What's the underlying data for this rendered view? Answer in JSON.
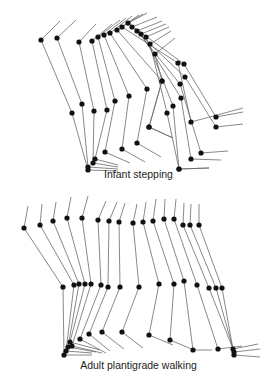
{
  "figures": [
    {
      "id": "infant",
      "caption": "Infant stepping",
      "caption_y": 176,
      "frames": [
        {
          "trunk": [
            [
              41,
              40
            ],
            [
              60,
              21
            ]
          ],
          "hip": [
            41,
            40
          ],
          "knee": [
            72,
            113
          ],
          "ankle": [
            88,
            170
          ],
          "toe": [
            118,
            171
          ]
        },
        {
          "trunk": [
            [
              57,
              38
            ],
            [
              76,
              20
            ]
          ],
          "hip": [
            57,
            38
          ],
          "knee": [
            82,
            104
          ],
          "ankle": [
            88,
            167
          ],
          "toe": [
            118,
            169
          ]
        },
        {
          "trunk": [
            [
              79,
              42
            ],
            [
              96,
              24
            ]
          ],
          "hip": [
            79,
            42
          ],
          "knee": [
            94,
            111
          ],
          "ankle": [
            93,
            163
          ],
          "toe": [
            118,
            167
          ]
        },
        {
          "trunk": [
            [
              92,
              41
            ],
            [
              112,
              24
            ]
          ],
          "hip": [
            92,
            41
          ],
          "knee": [
            107,
            110
          ],
          "ankle": [
            95,
            159
          ],
          "toe": [
            118,
            165
          ]
        },
        {
          "trunk": [
            [
              98,
              37
            ],
            [
              120,
              20
            ]
          ],
          "hip": [
            98,
            37
          ],
          "knee": [
            115,
            101
          ],
          "ankle": [
            105,
            152
          ],
          "toe": [
            130,
            163
          ]
        },
        {
          "trunk": [
            [
              104,
              35
            ],
            [
              126,
              18
            ]
          ],
          "hip": [
            104,
            35
          ],
          "knee": [
            129,
            96
          ],
          "ankle": [
            122,
            149
          ],
          "toe": [
            145,
            162
          ]
        },
        {
          "trunk": [
            [
              110,
              33
            ],
            [
              132,
              16
            ]
          ],
          "hip": [
            110,
            33
          ],
          "knee": [
            147,
            89
          ],
          "ankle": [
            137,
            143
          ],
          "toe": [
            161,
            157
          ]
        },
        {
          "trunk": [
            [
              117,
              30
            ],
            [
              139,
              15
            ]
          ],
          "hip": [
            117,
            30
          ],
          "knee": [
            162,
            81
          ],
          "ankle": [
            149,
            127
          ],
          "toe": [
            173,
            138
          ]
        },
        {
          "trunk": [
            [
              122,
              27
            ],
            [
              143,
              14
            ]
          ],
          "hip": [
            122,
            27
          ],
          "knee": [
            178,
            63
          ],
          "ankle": [
            191,
            122
          ],
          "toe": [
            243,
            108
          ]
        },
        {
          "trunk": [
            [
              128,
              23
            ],
            [
              147,
              13
            ]
          ],
          "hip": [
            128,
            23
          ],
          "knee": [
            184,
            64
          ],
          "ankle": [
            216,
            117
          ],
          "toe": [
            243,
            112
          ]
        },
        {
          "trunk": [
            [
              132,
              27
            ],
            [
              157,
              17
            ]
          ],
          "hip": [
            132,
            27
          ],
          "knee": [
            185,
            77
          ],
          "ankle": [
            216,
            127
          ],
          "toe": [
            243,
            124
          ]
        },
        {
          "trunk": [
            [
              137,
              31
            ],
            [
              162,
              21
            ]
          ],
          "hip": [
            137,
            31
          ],
          "knee": [
            180,
            84
          ],
          "ankle": [
            201,
            153
          ],
          "toe": [
            228,
            151
          ]
        },
        {
          "trunk": [
            [
              141,
              34
            ],
            [
              166,
              24
            ]
          ],
          "hip": [
            141,
            34
          ],
          "knee": [
            181,
            98
          ],
          "ankle": [
            191,
            159
          ],
          "toe": [
            221,
            160
          ]
        },
        {
          "trunk": [
            [
              146,
              37
            ],
            [
              169,
              27
            ]
          ],
          "hip": [
            146,
            37
          ],
          "knee": [
            173,
            106
          ],
          "ankle": [
            179,
            169
          ],
          "toe": [
            209,
            168
          ]
        },
        {
          "trunk": [
            [
              150,
              44
            ],
            [
              171,
              31
            ]
          ],
          "hip": [
            150,
            44
          ],
          "knee": [
            167,
            113
          ],
          "ankle": [
            179,
            169
          ],
          "toe": [
            209,
            168
          ]
        },
        {
          "trunk": [
            [
              155,
              54
            ],
            [
              175,
              38
            ]
          ],
          "hip": [
            155,
            54
          ],
          "knee": [
            162,
            81
          ],
          "ankle": [
            149,
            127
          ],
          "toe": [
            173,
            138
          ]
        }
      ]
    },
    {
      "id": "adult",
      "caption": "Adult plantigrade walking",
      "caption_y": 367,
      "frames": [
        {
          "trunk": [
            [
              24,
              228
            ],
            [
              28,
              206
            ]
          ],
          "hip": [
            24,
            228
          ],
          "knee": [
            63,
            287
          ],
          "ankle": [
            64,
            355
          ],
          "toe": [
            92,
            355
          ]
        },
        {
          "trunk": [
            [
              40,
              225
            ],
            [
              42,
              204
            ]
          ],
          "hip": [
            40,
            225
          ],
          "knee": [
            74,
            285
          ],
          "ankle": [
            66,
            351
          ],
          "toe": [
            92,
            353
          ]
        },
        {
          "trunk": [
            [
              53,
              221
            ],
            [
              56,
              202
            ]
          ],
          "hip": [
            53,
            221
          ],
          "knee": [
            79,
            284
          ],
          "ankle": [
            68,
            347
          ],
          "toe": [
            96,
            352
          ]
        },
        {
          "trunk": [
            [
              67,
              218
            ],
            [
              71,
              197
            ]
          ],
          "hip": [
            67,
            218
          ],
          "knee": [
            85,
            284
          ],
          "ankle": [
            70,
            342
          ],
          "toe": [
            100,
            350
          ]
        },
        {
          "trunk": [
            [
              82,
              218
            ],
            [
              88,
              196
            ]
          ],
          "hip": [
            82,
            218
          ],
          "knee": [
            91,
            284
          ],
          "ankle": [
            72,
            346
          ],
          "toe": [
            102,
            353
          ]
        },
        {
          "trunk": [
            [
              98,
              220
            ],
            [
              106,
              201
            ]
          ],
          "hip": [
            98,
            220
          ],
          "knee": [
            101,
            285
          ],
          "ankle": [
            80,
            339
          ],
          "toe": [
            106,
            353
          ]
        },
        {
          "trunk": [
            [
              109,
              221
            ],
            [
              117,
              202
            ]
          ],
          "hip": [
            109,
            221
          ],
          "knee": [
            108,
            287
          ],
          "ankle": [
            89,
            334
          ],
          "toe": [
            110,
            351
          ]
        },
        {
          "trunk": [
            [
              119,
              222
            ],
            [
              125,
              203
            ]
          ],
          "hip": [
            119,
            222
          ],
          "knee": [
            120,
            287
          ],
          "ankle": [
            102,
            332
          ],
          "toe": [
            124,
            349
          ]
        },
        {
          "trunk": [
            [
              133,
              223
            ],
            [
              137,
              204
            ]
          ],
          "hip": [
            133,
            223
          ],
          "knee": [
            139,
            287
          ],
          "ankle": [
            122,
            332
          ],
          "toe": [
            143,
            348
          ]
        },
        {
          "trunk": [
            [
              143,
              222
            ],
            [
              146,
              202
            ]
          ],
          "hip": [
            143,
            222
          ],
          "knee": [
            159,
            284
          ],
          "ankle": [
            149,
            335
          ],
          "toe": [
            173,
            345
          ]
        },
        {
          "trunk": [
            [
              153,
              221
            ],
            [
              156,
              199
            ]
          ],
          "hip": [
            153,
            221
          ],
          "knee": [
            174,
            284
          ],
          "ankle": [
            170,
            340
          ],
          "toe": [
            194,
            350
          ]
        },
        {
          "trunk": [
            [
              164,
              219
            ],
            [
              165,
              199
            ]
          ],
          "hip": [
            164,
            219
          ],
          "knee": [
            184,
            281
          ],
          "ankle": [
            193,
            350
          ],
          "toe": [
            212,
            350
          ]
        },
        {
          "trunk": [
            [
              174,
              219
            ],
            [
              176,
              199
            ]
          ],
          "hip": [
            174,
            219
          ],
          "knee": [
            197,
            285
          ],
          "ankle": [
            218,
            349
          ],
          "toe": [
            242,
            346
          ]
        },
        {
          "trunk": [
            [
              183,
              225
            ],
            [
              184,
              203
            ]
          ],
          "hip": [
            183,
            225
          ],
          "knee": [
            209,
            288
          ],
          "ankle": [
            233,
            349
          ],
          "toe": [
            258,
            344
          ]
        },
        {
          "trunk": [
            [
              190,
              225
            ],
            [
              191,
              204
            ]
          ],
          "hip": [
            190,
            225
          ],
          "knee": [
            216,
            288
          ],
          "ankle": [
            234,
            352
          ],
          "toe": [
            260,
            349
          ]
        },
        {
          "trunk": [
            [
              199,
              225
            ],
            [
              199,
              204
            ]
          ],
          "hip": [
            199,
            225
          ],
          "knee": [
            222,
            288
          ],
          "ankle": [
            234,
            355
          ],
          "toe": [
            260,
            357
          ]
        }
      ]
    }
  ],
  "colors": {
    "line": "#6a6a6a",
    "joint": "#111111",
    "text": "#222222",
    "background": "#ffffff"
  }
}
